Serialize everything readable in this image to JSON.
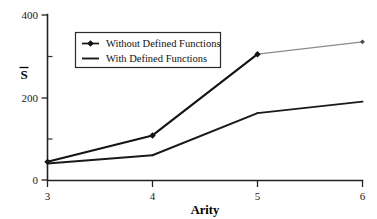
{
  "chart_data": {
    "type": "line",
    "title": "",
    "xlabel": "Arity",
    "ylabel": "S̄",
    "x": [
      3,
      4,
      5,
      6
    ],
    "xtick_labels": [
      "3",
      "4",
      "5",
      "6"
    ],
    "ytick_labels": [
      "0",
      "200",
      "400"
    ],
    "yticks": [
      0,
      200,
      400
    ],
    "yminor_ticks": [
      100,
      300
    ],
    "xlim": [
      3,
      6
    ],
    "ylim": [
      0,
      400
    ],
    "grid": false,
    "legend_position": "upper-left-inside",
    "series": [
      {
        "name": "Without Defined Functions",
        "values": [
          44,
          108,
          305,
          335
        ],
        "marker": "diamond",
        "color": "#141414",
        "tail_segment_color": "#8c8c8c",
        "line_width": 2.1
      },
      {
        "name": "With Defined Functions",
        "values": [
          40,
          60,
          162,
          190
        ],
        "marker": "none",
        "color": "#1a1a1a",
        "line_width": 1.9
      }
    ],
    "annotations": []
  },
  "axes": {
    "y_axis_label": "S̄",
    "x_axis_label": "Arity",
    "y_tick_400": "400",
    "y_tick_200": "200",
    "y_tick_0": "0",
    "x_tick_3": "3",
    "x_tick_4": "4",
    "x_tick_5": "5",
    "x_tick_6": "6"
  },
  "legend": {
    "entries": [
      {
        "label": "Without Defined Functions",
        "marker": "diamond-marker",
        "swatch": "line-with-diamond"
      },
      {
        "label": "With Defined Functions",
        "marker": "line-marker",
        "swatch": "plain-line"
      }
    ]
  },
  "colors": {
    "series_primary": "#141414",
    "series_secondary": "#1a1a1a",
    "series_primary_tail": "#8c8c8c",
    "axis": "#222222",
    "background": "#ffffff",
    "text": "#111111"
  }
}
